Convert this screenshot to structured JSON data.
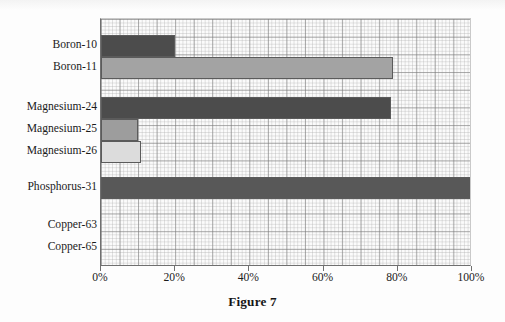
{
  "figure": {
    "caption": "Figure 7"
  },
  "chart_data": {
    "type": "bar",
    "orientation": "horizontal",
    "title": "Figure 7",
    "xlabel": "",
    "ylabel": "",
    "xlim": [
      0,
      100
    ],
    "x_unit": "%",
    "grid": true,
    "legend": null,
    "categories": [
      "Boron-10",
      "Boron-11",
      "Magnesium-24",
      "Magnesium-25",
      "Magnesium-26",
      "Phosphorus-31",
      "Copper-63",
      "Copper-65"
    ],
    "values": [
      19.9,
      78.7,
      78.2,
      10.0,
      10.8,
      100.0,
      0,
      0
    ],
    "value_labels": [
      "19.9%",
      "78.7%",
      "78.2%",
      "10.0%",
      "10.8%",
      "100%",
      "",
      ""
    ],
    "bar_colors": [
      "#4c4c4c",
      "#a3a3a3",
      "#4c4c4c",
      "#9d9d9d",
      "#dcdcdc",
      "#585858",
      "#4c4c4c",
      "#a3a3a3"
    ],
    "bar_border_color": "#5b5b5b",
    "xticks": [
      0,
      20,
      40,
      60,
      80,
      100
    ],
    "xtick_labels": [
      "0%",
      "20%",
      "40%",
      "60%",
      "80%",
      "100%"
    ],
    "row_layout": [
      {
        "category": "Boron-10",
        "top": 16,
        "height": 22
      },
      {
        "category": "Boron-11",
        "top": 38,
        "height": 22
      },
      {
        "category": "Magnesium-24",
        "top": 78,
        "height": 22
      },
      {
        "category": "Magnesium-25",
        "top": 100,
        "height": 22
      },
      {
        "category": "Magnesium-26",
        "top": 122,
        "height": 22
      },
      {
        "category": "Phosphorus-31",
        "top": 158,
        "height": 22
      },
      {
        "category": "Copper-63",
        "top": 196,
        "height": 22
      },
      {
        "category": "Copper-65",
        "top": 218,
        "height": 22
      }
    ]
  }
}
